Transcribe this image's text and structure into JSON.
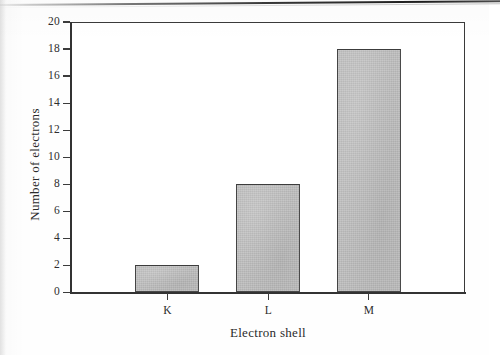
{
  "chart_data": {
    "type": "bar",
    "title": "",
    "categories": [
      "K",
      "L",
      "M"
    ],
    "values": [
      2,
      8,
      18
    ],
    "series": [
      {
        "name": "Number of electrons",
        "values": [
          2,
          8,
          18
        ]
      }
    ],
    "xlabel": "Electron shell",
    "ylabel": "Number of electrons",
    "ylim": [
      0,
      20
    ],
    "ytick_labels": [
      "0",
      "2",
      "4",
      "6",
      "8",
      "10",
      "12",
      "14",
      "16",
      "18",
      "20"
    ],
    "ytick_values": [
      0,
      2,
      4,
      6,
      8,
      10,
      12,
      14,
      16,
      18,
      20
    ],
    "xtick_labels": [
      "K",
      "L",
      "M"
    ],
    "grid": false,
    "legend": false,
    "legend_position": "none",
    "bar_fill_color": "#bfbfbf",
    "bar_border_color": "#4a4a4a",
    "axis_color": "#333333",
    "background_color": "#ffffff"
  },
  "figure": {
    "y_axis_title": "Number of electrons",
    "x_axis_title": "Electron shell",
    "artifact_label": "scan-edge-line"
  }
}
